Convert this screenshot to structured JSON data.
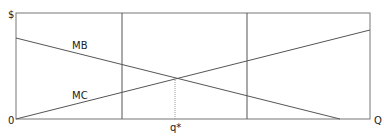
{
  "diagram": {
    "y_axis_label": "$",
    "x_axis_label": "Q",
    "origin_label": "0",
    "equilibrium_label": "q*",
    "curves": [
      {
        "name": "MB",
        "label": "MB"
      },
      {
        "name": "MC",
        "label": "MC"
      }
    ],
    "colors": {
      "line": "#555555",
      "dotted": "#999999",
      "text": "#222222"
    }
  }
}
